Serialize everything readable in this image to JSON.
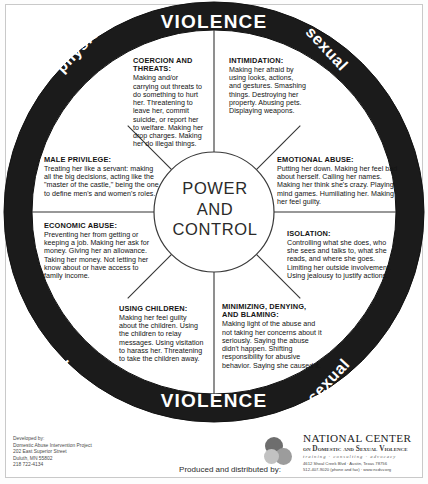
{
  "diagram": {
    "center": {
      "line1": "POWER",
      "line2": "AND",
      "line3": "CONTROL"
    },
    "ring": {
      "violence_top": "VIOLENCE",
      "violence_bottom": "VIOLENCE",
      "physical_top_left": "physical",
      "physical_bottom_left": "physical",
      "sexual_top_right": "sexual",
      "sexual_bottom_right": "sexual",
      "ring_color": "#1b1b1b",
      "ring_text_color": "#ffffff"
    },
    "segments": [
      {
        "id": "coercion",
        "heading": "COERCION AND THREATS:",
        "body": "Making and/or carrying out threats to do something to hurt her. Threatening to leave her, commit suicide, or report her to welfare. Making her drop charges. Making her do illegal things."
      },
      {
        "id": "intimidation",
        "heading": "INTIMIDATION:",
        "body": "Making her afraid by using looks, actions, and gestures. Smashing things. Destroying her property. Abusing pets. Displaying weapons."
      },
      {
        "id": "emotional-abuse",
        "heading": "EMOTIONAL ABUSE:",
        "body": "Putting her down. Making her feel bad about herself. Calling her names. Making her think she's crazy. Playing mind games. Humiliating her. Making her feel guilty."
      },
      {
        "id": "isolation",
        "heading": "ISOLATION:",
        "body": "Controlling what she does, who she sees and talks to, what she reads, and where she goes. Limiting her outside involvement. Using jealousy to justify actions."
      },
      {
        "id": "minimizing-denying-blaming",
        "heading": "MINIMIZING, DENYING, AND BLAMING:",
        "body": "Making light of the abuse and not taking her concerns about it seriously. Saying the abuse didn't happen. Shifting responsibility for abusive behavior. Saying she caused it."
      },
      {
        "id": "using-children",
        "heading": "USING CHILDREN:",
        "body": "Making her feel guilty about the children. Using the children to relay messages. Using visitation to harass her. Threatening to take the children away."
      },
      {
        "id": "economic-abuse",
        "heading": "ECONOMIC ABUSE:",
        "body": "Preventing her from getting or keeping a job. Making her ask for money. Giving her an allowance. Taking her money. Not letting her know about or have access to family income."
      },
      {
        "id": "male-privilege",
        "heading": "MALE PRIVILEGE:",
        "body": "Treating her like a servant: making all the big decisions, acting like the \"master of the castle,\" being the one to define men's and women's roles."
      }
    ]
  },
  "footer": {
    "developed_by": {
      "label": "Developed by:",
      "org": "Domestic Abuse Intervention Project",
      "street": "202 East Superior Street",
      "city": "Duluth, MN 55802",
      "phone": "218 722-4134"
    },
    "produced_by": "Produced and distributed by:",
    "ncdsv": {
      "name_line1": "NATIONAL CENTER",
      "name_line2": "on Domestic and Sexual Violence",
      "tagline": "training  ·  consulting  ·  advocacy",
      "address": "4612 Shoal Creek Blvd   ·   Austin, Texas 78756",
      "contact": "512-407-9020 (phone and fax)   ·   www.ncdsv.org"
    }
  }
}
